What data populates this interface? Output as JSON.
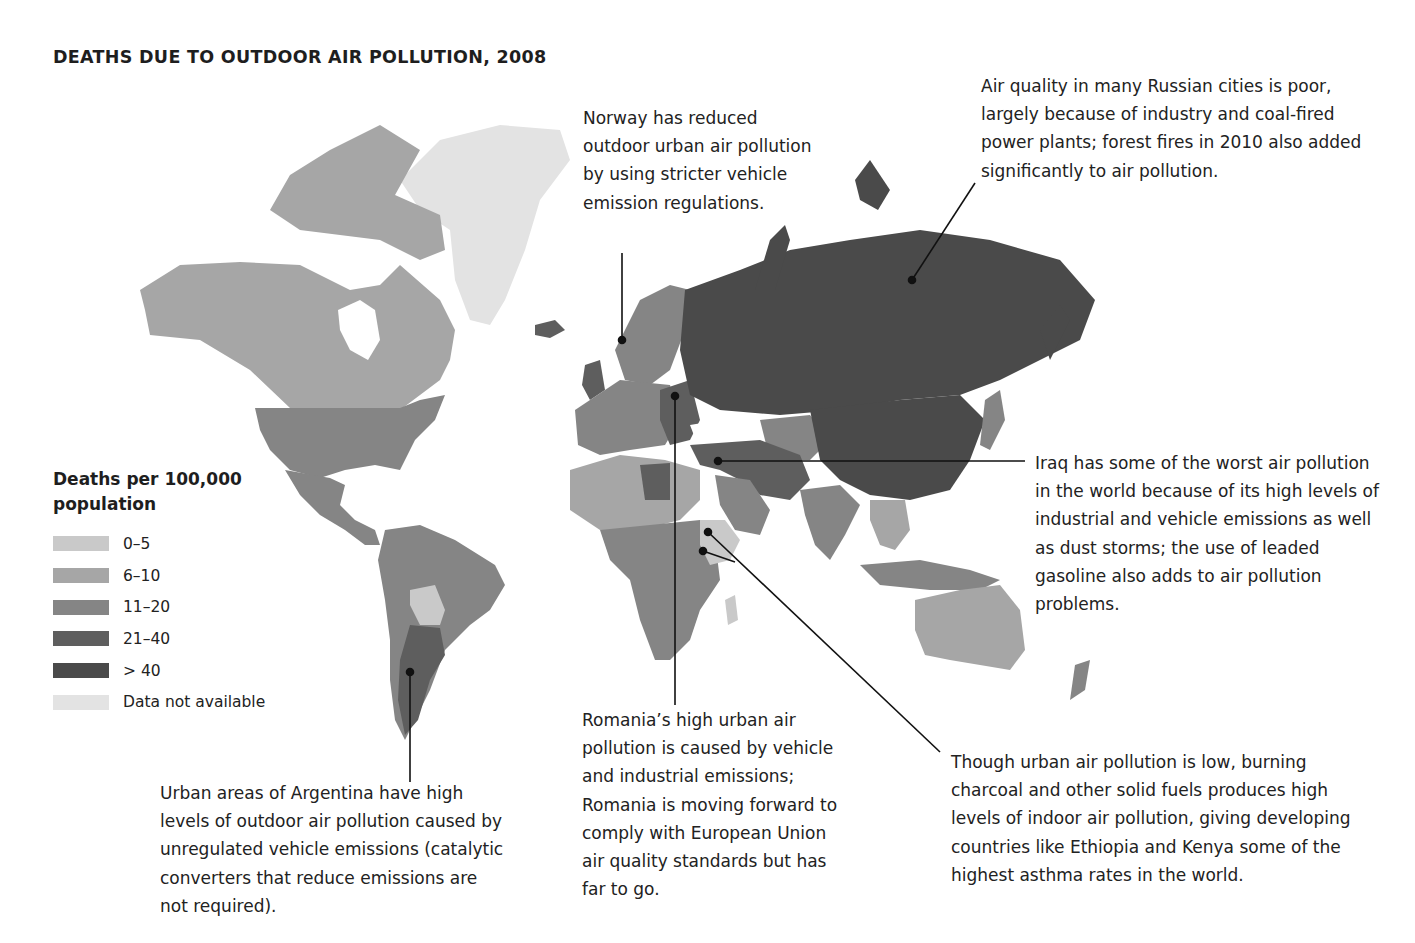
{
  "title": "DEATHS DUE TO OUTDOOR AIR POLLUTION, 2008",
  "legend": {
    "title": "Deaths per 100,000 population",
    "items": [
      {
        "label": "0–5",
        "color": "#c9c9c9"
      },
      {
        "label": "6–10",
        "color": "#a6a6a6"
      },
      {
        "label": "11–20",
        "color": "#858585"
      },
      {
        "label": "21–40",
        "color": "#5e5e5e"
      },
      {
        "label": "> 40",
        "color": "#4a4a4a"
      },
      {
        "label": "Data not available",
        "color": "#e3e3e3"
      }
    ]
  },
  "annotations": {
    "norway": "Norway has reduced outdoor urban air pollution by using stricter vehicle emission regulations.",
    "russia": "Air quality in many Russian cities is poor, largely because of industry and coal-fired power plants; forest fires in 2010 also added significantly to air pollution.",
    "iraq": "Iraq has some of the worst air pollution in the world because of its high levels of industrial and vehicle emissions as well as dust storms; the use of leaded gasoline also adds to air pollution problems.",
    "ethiopia_kenya": "Though urban air pollution is low, burning charcoal and other solid fuels produces high levels of indoor air pollution, giving developing countries like Ethiopia and Kenya some of the highest asthma rates in the world.",
    "romania": "Romania’s high urban air pollution is caused by vehicle and industrial emissions; Romania is moving forward to comply with European Union air quality standards but has far to go.",
    "argentina": "Urban areas of Argentina have high levels of outdoor air pollution caused by unregulated vehicle emissions (catalytic converters that reduce emissions are not required)."
  },
  "region_shading": {
    "greenland": "Data not available",
    "canada_alaska": "6–10",
    "usa": "11–20",
    "mexico": "11–20",
    "brazil": "11–20",
    "bolivia": "0–5",
    "argentina": "21–40",
    "russia": "> 40",
    "china": "> 40",
    "india": "11–20",
    "australia": "6–10",
    "western_europe": "11–20",
    "eastern_europe": "21–40",
    "north_africa": "6–10",
    "libya": "21–40",
    "central_africa": "11–20",
    "ethiopia_kenya": "0–5",
    "southern_africa": "11–20",
    "iraq_iran": "21–40"
  }
}
